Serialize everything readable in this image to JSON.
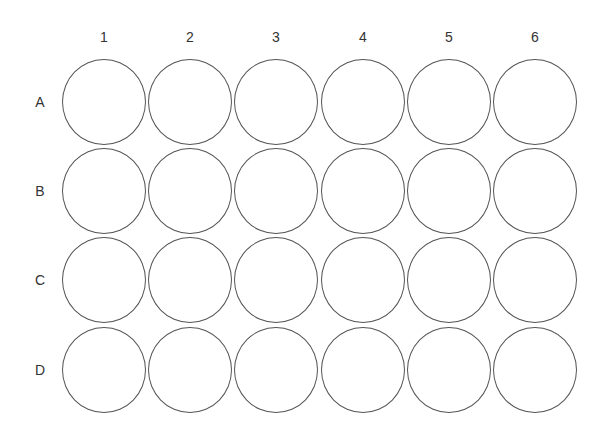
{
  "plate": {
    "type": "24-well plate",
    "columns": [
      "1",
      "2",
      "3",
      "4",
      "5",
      "6"
    ],
    "rows": [
      "A",
      "B",
      "C",
      "D"
    ],
    "line_color": "#555555",
    "label_color": "#333333",
    "background": "#ffffff"
  }
}
